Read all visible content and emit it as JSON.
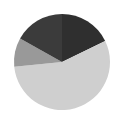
{
  "chart_data": {
    "type": "pie",
    "title": "",
    "start_angle_deg": 0,
    "direction": "clockwise",
    "center": [
      62,
      62
    ],
    "radius": 48,
    "legend": null,
    "slices": [
      {
        "label": "",
        "value": 17.8,
        "color": "#2f2f2f"
      },
      {
        "label": "",
        "value": 55.6,
        "color": "#cfcfcf"
      },
      {
        "label": "",
        "value": 9.7,
        "color": "#999999"
      },
      {
        "label": "",
        "value": 16.9,
        "color": "#3b3b3b"
      }
    ]
  },
  "page": {
    "background": "#ffffff",
    "aria_label": "Pie chart"
  }
}
